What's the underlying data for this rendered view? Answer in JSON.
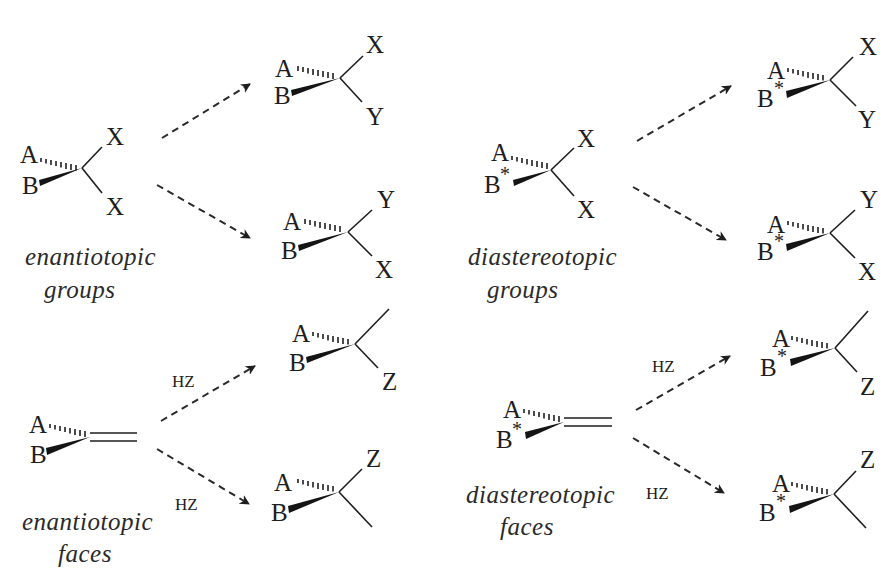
{
  "diagram": {
    "panels": {
      "enantiotopic_groups": {
        "caption_line1": "enantiotopic",
        "caption_line2": "groups",
        "substrate": {
          "a": "A",
          "b": "B",
          "b_mark": "",
          "up": "X",
          "down": "X"
        },
        "product_top": {
          "a": "A",
          "b": "B",
          "b_mark": "",
          "up": "X",
          "down": "Y"
        },
        "product_bottom": {
          "a": "A",
          "b": "B",
          "b_mark": "",
          "up": "Y",
          "down": "X"
        }
      },
      "diastereotopic_groups": {
        "caption_line1": "diastereotopic",
        "caption_line2": "groups",
        "substrate": {
          "a": "A",
          "b": "B",
          "b_mark": "*",
          "up": "X",
          "down": "X"
        },
        "product_top": {
          "a": "A",
          "b": "B",
          "b_mark": "*",
          "up": "X",
          "down": "Y"
        },
        "product_bottom": {
          "a": "A",
          "b": "B",
          "b_mark": "*",
          "up": "Y",
          "down": "X"
        }
      },
      "enantiotopic_faces": {
        "caption_line1": "enantiotopic",
        "caption_line2": "faces",
        "reagent_top": "HZ",
        "reagent_bottom": "HZ",
        "substrate": {
          "a": "A",
          "b": "B",
          "b_mark": "",
          "bond": "double"
        },
        "product_top": {
          "a": "A",
          "b": "B",
          "b_mark": "",
          "up": "",
          "down": "Z"
        },
        "product_bottom": {
          "a": "A",
          "b": "B",
          "b_mark": "",
          "up": "Z",
          "down": ""
        }
      },
      "diastereotopic_faces": {
        "caption_line1": "diastereotopic",
        "caption_line2": "faces",
        "reagent_top": "HZ",
        "reagent_bottom": "HZ",
        "substrate": {
          "a": "A",
          "b": "B",
          "b_mark": "*",
          "bond": "double"
        },
        "product_top": {
          "a": "A",
          "b": "B",
          "b_mark": "*",
          "up": "",
          "down": "Z"
        },
        "product_bottom": {
          "a": "A",
          "b": "B",
          "b_mark": "*",
          "up": "Z",
          "down": ""
        }
      }
    },
    "icons": {
      "hashed_bond": "hashed-wedge-bond",
      "solid_wedge": "solid-wedge-bond",
      "dashed_arrow": "dashed-arrow"
    }
  }
}
